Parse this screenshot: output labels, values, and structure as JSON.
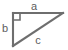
{
  "figure": {
    "type": "right-triangle-diagram",
    "background_color": "#ffffff",
    "stroke_color": "#6e6e6e",
    "label_color": "#5d5d5d",
    "vertices": {
      "right_angle": {
        "x": 13,
        "y": 13
      },
      "top_right": {
        "x": 63,
        "y": 13
      },
      "bottom_left": {
        "x": 13,
        "y": 46
      }
    },
    "right_angle_marker": {
      "name": "right-angle-square",
      "x": 13,
      "y": 13,
      "size": 7
    },
    "edges": [
      {
        "id": "a",
        "label": "a",
        "role": "horizontal-leg",
        "x1": 13,
        "y1": 13,
        "x2": 63,
        "y2": 13,
        "label_x": 34,
        "label_y": 10
      },
      {
        "id": "b",
        "label": "b",
        "role": "vertical-leg",
        "x1": 13,
        "y1": 13,
        "x2": 13,
        "y2": 46,
        "label_x": 5,
        "label_y": 32
      },
      {
        "id": "c",
        "label": "c",
        "role": "hypotenuse",
        "x1": 13,
        "y1": 46,
        "x2": 63,
        "y2": 13,
        "label_x": 38,
        "label_y": 44
      }
    ]
  }
}
